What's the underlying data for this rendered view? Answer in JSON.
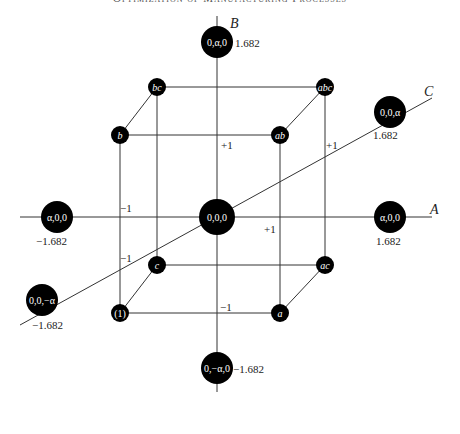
{
  "header": {
    "title": "Optimization of Manufacturing Processes"
  },
  "axes": {
    "A": "A",
    "B": "B",
    "C": "C"
  },
  "tick_labels": {
    "b_plus": "+1",
    "a_plus": "+1",
    "c_plus": "+1",
    "a_minus": "−1",
    "c_minus": "−1",
    "b_minus": "−1"
  },
  "axial_points": [
    {
      "id": "b-pos",
      "label": "0,α,0",
      "value": "1.682"
    },
    {
      "id": "b-neg",
      "label": "0,−α,0",
      "value": "−1.682"
    },
    {
      "id": "a-neg",
      "label": "α,0,0",
      "value": "−1.682"
    },
    {
      "id": "a-pos",
      "label": "α,0,0",
      "value": "1.682"
    },
    {
      "id": "c-pos",
      "label": "0,0,α",
      "value": "1.682"
    },
    {
      "id": "c-neg",
      "label": "0,0,−α",
      "value": "−1.682"
    }
  ],
  "center_point": {
    "label": "0,0,0"
  },
  "factorial_points": [
    {
      "id": "bc",
      "label": "bc"
    },
    {
      "id": "abc",
      "label": "abc"
    },
    {
      "id": "b",
      "label": "b"
    },
    {
      "id": "ab",
      "label": "ab"
    },
    {
      "id": "c",
      "label": "c"
    },
    {
      "id": "ac",
      "label": "ac"
    },
    {
      "id": "one",
      "label": "(1)"
    },
    {
      "id": "a",
      "label": "a"
    }
  ],
  "colors": {
    "node": "#000000",
    "line": "#333333",
    "text": "#222222"
  }
}
